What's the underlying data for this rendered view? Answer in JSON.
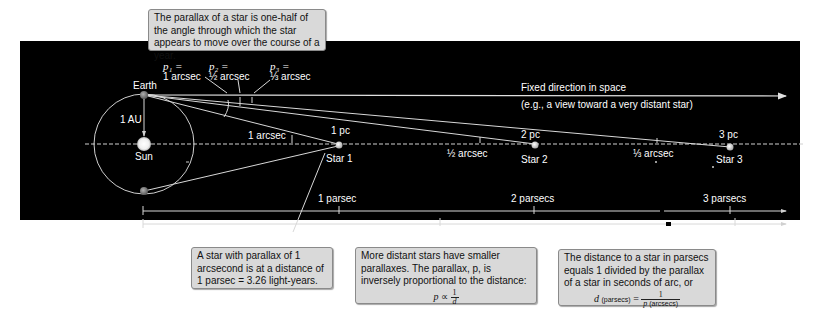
{
  "callouts": {
    "top": "The parallax of a star is one-half of the angle through which the star appears to move over the course of a year.",
    "bottom_left": "A star with parallax of 1 arcsecond is at a distance of 1 parsec = 3.26 light-years.",
    "bottom_middle": {
      "text": "More distant stars have smaller parallaxes. The parallax, p, is inversely proportional to the distance:",
      "eq_lhs": "p",
      "eq_op": "∝",
      "eq_num": "1",
      "eq_den": "d"
    },
    "bottom_right": {
      "text": "The distance to a star in parsecs equals 1 divided by the parallax of a star in seconds of arc, or",
      "eq_lhs": "d",
      "eq_lhs_unit": "(parsecs)",
      "eq_op": "=",
      "eq_num": "1",
      "eq_den": "p",
      "eq_den_unit": "(arcsecs)"
    }
  },
  "labels": {
    "p1_name": "p₁ =",
    "p1_value": "1 arcsec",
    "p2_name": "p₂ =",
    "p2_value": "½ arcsec",
    "p3_name": "p₃ =",
    "p3_value": "⅓ arcsec",
    "earth": "Earth",
    "sun": "Sun",
    "au": "1 AU",
    "fixed_direction": "Fixed direction in space",
    "fixed_direction_sub": "(e.g., a view toward a very distant star)",
    "angle_1": "1 arcsec",
    "angle_2": "½ arcsec",
    "angle_3": "⅓ arcsec",
    "pc1": "1 pc",
    "pc2": "2 pc",
    "pc3": "3 pc",
    "star1": "Star 1",
    "star2": "Star 2",
    "star3": "Star 3"
  },
  "scales": {
    "parsec_ticks": [
      "1 parsec",
      "2 parsecs",
      "3 parsecs"
    ],
    "lightyear_ticks": [
      "5 light-years",
      "10 light-years"
    ]
  },
  "colors": {
    "panel_bg": "#000000",
    "line": "#d8d8d8",
    "callout_bg": "#d9d9d9",
    "planet": "#8a8a8a"
  }
}
